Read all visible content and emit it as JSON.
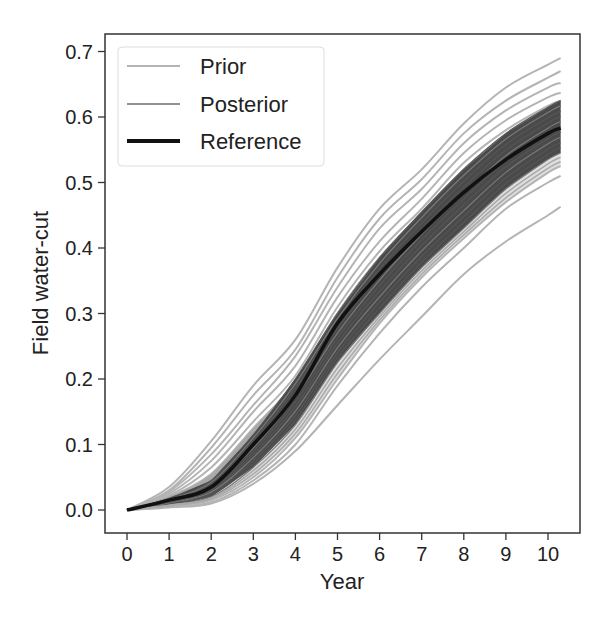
{
  "chart_data": {
    "type": "line",
    "title": "",
    "xlabel": "Year",
    "ylabel": "Field water-cut",
    "xlim": [
      -0.5,
      10.75
    ],
    "ylim": [
      -0.034,
      0.728
    ],
    "xticks": [
      0,
      1,
      2,
      3,
      4,
      5,
      6,
      7,
      8,
      9,
      10
    ],
    "xtick_labels": [
      "0",
      "1",
      "2",
      "3",
      "4",
      "5",
      "6",
      "7",
      "8",
      "9",
      "10"
    ],
    "yticks": [
      0.0,
      0.1,
      0.2,
      0.3,
      0.4,
      0.5,
      0.6,
      0.7
    ],
    "ytick_labels": [
      "0.0",
      "0.1",
      "0.2",
      "0.3",
      "0.4",
      "0.5",
      "0.6",
      "0.7"
    ],
    "grid": false,
    "legend_position": "upper left",
    "legend": [
      {
        "label": "Prior",
        "color": "#b4b4b4",
        "width": 2
      },
      {
        "label": "Posterior",
        "color": "#6e6e6e",
        "width": 1.5
      },
      {
        "label": "Reference",
        "color": "#111111",
        "width": 4
      }
    ],
    "x": [
      0,
      1,
      2,
      3,
      4,
      5,
      6,
      7,
      8,
      9,
      10,
      10.3
    ],
    "series": [
      {
        "name": "Reference",
        "role": "reference",
        "values": [
          0.0,
          0.015,
          0.035,
          0.1,
          0.175,
          0.285,
          0.36,
          0.425,
          0.485,
          0.535,
          0.575,
          0.583
        ]
      },
      {
        "name": "Posterior lower bound",
        "role": "posterior_band_low",
        "values": [
          0.0,
          0.008,
          0.02,
          0.065,
          0.13,
          0.225,
          0.3,
          0.37,
          0.43,
          0.49,
          0.535,
          0.545
        ]
      },
      {
        "name": "Posterior upper bound",
        "role": "posterior_band_high",
        "values": [
          0.0,
          0.018,
          0.045,
          0.115,
          0.2,
          0.3,
          0.385,
          0.455,
          0.52,
          0.575,
          0.615,
          0.625
        ]
      },
      {
        "name": "Prior max",
        "role": "prior",
        "values": [
          0.0,
          0.035,
          0.105,
          0.19,
          0.26,
          0.37,
          0.46,
          0.52,
          0.59,
          0.645,
          0.68,
          0.69
        ]
      },
      {
        "name": "Prior 2",
        "role": "prior",
        "values": [
          0.0,
          0.03,
          0.095,
          0.175,
          0.245,
          0.355,
          0.445,
          0.505,
          0.575,
          0.625,
          0.66,
          0.67
        ]
      },
      {
        "name": "Prior 3",
        "role": "prior",
        "values": [
          0.0,
          0.028,
          0.085,
          0.16,
          0.235,
          0.34,
          0.43,
          0.49,
          0.56,
          0.61,
          0.645,
          0.652
        ]
      },
      {
        "name": "Prior 4",
        "role": "prior",
        "values": [
          0.0,
          0.025,
          0.075,
          0.15,
          0.22,
          0.325,
          0.41,
          0.475,
          0.545,
          0.595,
          0.63,
          0.637
        ]
      },
      {
        "name": "Prior 5",
        "role": "prior",
        "values": [
          0.0,
          0.022,
          0.065,
          0.135,
          0.205,
          0.31,
          0.395,
          0.46,
          0.53,
          0.58,
          0.617,
          0.625
        ]
      },
      {
        "name": "Prior 6",
        "role": "prior",
        "values": [
          0.0,
          0.02,
          0.055,
          0.125,
          0.195,
          0.3,
          0.385,
          0.45,
          0.52,
          0.57,
          0.607,
          0.615
        ]
      },
      {
        "name": "Prior 7",
        "role": "prior",
        "values": [
          0.0,
          0.006,
          0.015,
          0.05,
          0.11,
          0.2,
          0.285,
          0.355,
          0.415,
          0.47,
          0.515,
          0.525
        ]
      },
      {
        "name": "Prior 8",
        "role": "prior",
        "values": [
          0.0,
          0.005,
          0.012,
          0.045,
          0.1,
          0.19,
          0.27,
          0.34,
          0.4,
          0.46,
          0.5,
          0.51
        ]
      },
      {
        "name": "Prior min",
        "role": "prior",
        "values": [
          0.0,
          0.004,
          0.01,
          0.04,
          0.09,
          0.16,
          0.23,
          0.295,
          0.36,
          0.41,
          0.45,
          0.463
        ]
      }
    ]
  }
}
